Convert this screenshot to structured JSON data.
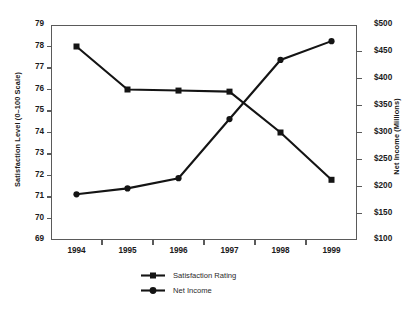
{
  "chart_data": {
    "type": "line",
    "title": "",
    "subtitle": "",
    "xlabel": "",
    "ylabel": "Satisfaction Level (0–100 Scale)",
    "y2label": "Net Income (Millions)",
    "categories": [
      "1994",
      "1995",
      "1996",
      "1997",
      "1998",
      "1999"
    ],
    "x_tick_labels": [
      "1994",
      "1995",
      "1996",
      "1997",
      "1998",
      "1999"
    ],
    "y_tick_labels": [
      "79",
      "78",
      "77",
      "76",
      "75",
      "74",
      "73",
      "72",
      "71",
      "70",
      "69"
    ],
    "y_tick_values": [
      79,
      78,
      77,
      76,
      75,
      74,
      73,
      72,
      71,
      70,
      69
    ],
    "y2_tick_labels": [
      "$500",
      "$450",
      "$400",
      "$350",
      "$300",
      "$250",
      "$200",
      "$150",
      "$100"
    ],
    "y2_tick_values": [
      500,
      450,
      400,
      350,
      300,
      250,
      200,
      150,
      100
    ],
    "ylim": [
      69,
      79
    ],
    "y2lim": [
      100,
      500
    ],
    "grid": false,
    "legend_position": "bottom",
    "series": [
      {
        "name": "Satisfaction Rating",
        "axis": "left",
        "marker": "square",
        "color": "#141414",
        "values": [
          78.0,
          76.0,
          75.95,
          75.9,
          74.0,
          71.8
        ]
      },
      {
        "name": "Net Income",
        "axis": "right",
        "marker": "circle",
        "color": "#141414",
        "values": [
          185,
          196,
          215,
          325,
          435,
          470
        ]
      }
    ]
  },
  "legend": {
    "items": [
      {
        "label": "Satisfaction Rating",
        "marker": "square"
      },
      {
        "label": "Net Income",
        "marker": "circle"
      }
    ]
  },
  "colors": {
    "ink": "#141414",
    "axis": "#5a5a5a",
    "background": "#ffffff"
  }
}
